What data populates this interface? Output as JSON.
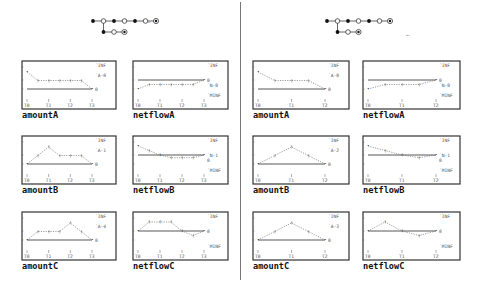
{
  "chart_data": [
    {
      "panel": "left",
      "name": "amountA",
      "type": "line",
      "x": [
        "T0",
        "T1",
        "T2",
        "T3"
      ],
      "labels": [
        "INF",
        "A-0",
        "0"
      ],
      "values": [
        2,
        1,
        1,
        1,
        1,
        1,
        0
      ],
      "xpos": [
        0,
        0.5,
        1,
        1.5,
        2,
        2.5,
        3
      ]
    },
    {
      "panel": "left",
      "name": "netflowA",
      "type": "line",
      "x": [
        "T0",
        "T1",
        "T2",
        "T3"
      ],
      "labels": [
        "INF",
        "0",
        "N-0",
        "MINF"
      ],
      "values": [
        -1,
        -0.5,
        -0.5,
        -0.5,
        -0.5,
        -0.5,
        0
      ],
      "xpos": [
        0,
        0.5,
        1,
        1.5,
        2,
        2.5,
        3
      ]
    },
    {
      "panel": "left",
      "name": "amountB",
      "type": "line",
      "x": [
        "T0",
        "T1",
        "T2",
        "T3"
      ],
      "labels": [
        "INF",
        "A-1",
        "0"
      ],
      "values": [
        0,
        1,
        2,
        1,
        1,
        1,
        0
      ],
      "xpos": [
        0,
        0.5,
        1,
        1.5,
        2,
        2.5,
        3
      ]
    },
    {
      "panel": "left",
      "name": "netflowB",
      "type": "line",
      "x": [
        "T0",
        "T1",
        "T2",
        "T3"
      ],
      "labels": [
        "INF",
        "N-1",
        "0",
        "MINF"
      ],
      "values": [
        1,
        0.5,
        0,
        -0.3,
        -0.3,
        -0.3,
        0
      ],
      "xpos": [
        0,
        0.5,
        1,
        1.5,
        2,
        2.5,
        3
      ]
    },
    {
      "panel": "left",
      "name": "amountC",
      "type": "line",
      "x": [
        "T0",
        "T1",
        "T2",
        "T3"
      ],
      "labels": [
        "INF",
        "A-4",
        "0"
      ],
      "values": [
        0,
        1,
        1,
        1,
        2,
        1,
        0
      ],
      "xpos": [
        0,
        0.5,
        1,
        1.5,
        2,
        2.5,
        3
      ]
    },
    {
      "panel": "left",
      "name": "netflowC",
      "type": "line",
      "x": [
        "T0",
        "T1",
        "T2",
        "T3"
      ],
      "labels": [
        "INF",
        "0",
        "MINF"
      ],
      "values": [
        0,
        1,
        1,
        1,
        0,
        -0.5,
        0
      ],
      "xpos": [
        0,
        0.5,
        1,
        1.5,
        2,
        2.5,
        3
      ]
    },
    {
      "panel": "right",
      "name": "amountA",
      "type": "line",
      "x": [
        "T0",
        "T1",
        "T2"
      ],
      "labels": [
        "INF",
        "A-0",
        "0"
      ],
      "values": [
        2,
        1,
        1,
        1,
        0
      ],
      "xpos": [
        0,
        0.5,
        1,
        1.5,
        2
      ]
    },
    {
      "panel": "right",
      "name": "netflowA",
      "type": "line",
      "x": [
        "T0",
        "T1",
        "T2"
      ],
      "labels": [
        "INF",
        "0",
        "N-0",
        "MINF"
      ],
      "values": [
        -1,
        -0.5,
        -0.5,
        -0.5,
        0
      ],
      "xpos": [
        0,
        0.5,
        1,
        1.5,
        2
      ]
    },
    {
      "panel": "right",
      "name": "amountB",
      "type": "line",
      "x": [
        "T0",
        "T1",
        "T2"
      ],
      "labels": [
        "INF",
        "A-2",
        "0"
      ],
      "values": [
        0,
        1,
        2,
        1,
        0
      ],
      "xpos": [
        0,
        0.5,
        1,
        1.5,
        2
      ]
    },
    {
      "panel": "right",
      "name": "netflowB",
      "type": "line",
      "x": [
        "T0",
        "T1",
        "T2"
      ],
      "labels": [
        "INF",
        "N-1",
        "0",
        "MINF"
      ],
      "values": [
        1,
        0.5,
        0,
        -0.3,
        0
      ],
      "xpos": [
        0,
        0.5,
        1,
        1.5,
        2
      ]
    },
    {
      "panel": "right",
      "name": "amountC",
      "type": "line",
      "x": [
        "T0",
        "T1",
        "T2"
      ],
      "labels": [
        "INF",
        "A-3",
        "0"
      ],
      "values": [
        0,
        1,
        2,
        1,
        0
      ],
      "xpos": [
        0,
        0.5,
        1,
        1.5,
        2
      ]
    },
    {
      "panel": "right",
      "name": "netflowC",
      "type": "line",
      "x": [
        "T0",
        "T1",
        "T2"
      ],
      "labels": [
        "INF",
        "0",
        "MINF"
      ],
      "values": [
        0,
        1,
        0,
        -0.5,
        0
      ],
      "xpos": [
        0,
        0.5,
        1,
        1.5,
        2
      ]
    }
  ],
  "panels": {
    "left": {
      "tree": {
        "main": [
          "filled",
          "open",
          "filled",
          "open",
          "filled",
          "open",
          "target"
        ],
        "branch": [
          "filled",
          "open",
          "target"
        ],
        "arrow": "←"
      },
      "titles": [
        "amountA",
        "netflowA",
        "amountB",
        "netflowB",
        "amountC",
        "netflowC"
      ]
    },
    "right": {
      "tree": {
        "main": [
          "filled",
          "open",
          "filled",
          "open",
          "filled",
          "open",
          "target"
        ],
        "branch": [
          "filled",
          "open",
          "target"
        ],
        "arrow": "←"
      },
      "titles": [
        "amountA",
        "netflowA",
        "amountB",
        "netflowB",
        "amountC",
        "netflowC"
      ]
    }
  }
}
